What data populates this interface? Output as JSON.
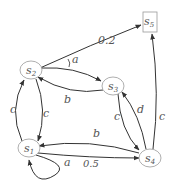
{
  "nodes": {
    "s1": "s1",
    "s2": "s2",
    "s3": "s3",
    "s4": "s4",
    "s5": "s5"
  },
  "node_sub": {
    "s1": "1",
    "s2": "2",
    "s3": "3",
    "s4": "4",
    "s5": "5"
  },
  "edges": {
    "s2_s5": "0.2",
    "s2_s3": "a",
    "s3_s2": "b",
    "s2_s1": "c",
    "s1_s2": "c",
    "s4_s3": "d",
    "s3_s4": "c",
    "s4_s5": "c",
    "s4_s1": "b",
    "s1_s4": "0.5",
    "s1_s1": "a"
  }
}
